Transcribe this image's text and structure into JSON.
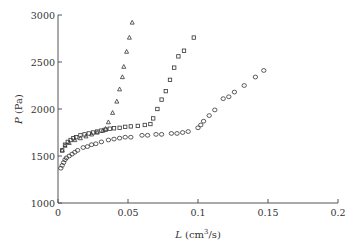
{
  "chart_data": {
    "type": "scatter",
    "title": "",
    "xlabel": "L (cm³/s)",
    "xlabel_parts": {
      "var": "L",
      "unit_pre": " (cm",
      "sup": "3",
      "unit_post": "/s)"
    },
    "ylabel": "P (Pa)",
    "ylabel_parts": {
      "var": "P",
      "unit": " (Pa)"
    },
    "xlim": [
      0,
      0.2
    ],
    "ylim": [
      1000,
      3000
    ],
    "xticks": [
      0,
      0.05,
      0.1,
      0.15,
      0.2
    ],
    "xtick_labels": [
      "0",
      "0.05",
      "0.1",
      "0.15",
      "0.2"
    ],
    "yticks": [
      1000,
      1500,
      2000,
      2500,
      3000
    ],
    "ytick_labels": [
      "1000",
      "1500",
      "2000",
      "2500",
      "3000"
    ],
    "grid": false,
    "legend": null,
    "series": [
      {
        "name": "triangles",
        "marker": "triangle",
        "points": [
          [
            0.003,
            1560
          ],
          [
            0.005,
            1610
          ],
          [
            0.008,
            1640
          ],
          [
            0.012,
            1670
          ],
          [
            0.016,
            1690
          ],
          [
            0.02,
            1710
          ],
          [
            0.024,
            1730
          ],
          [
            0.028,
            1750
          ],
          [
            0.032,
            1770
          ],
          [
            0.034,
            1790
          ],
          [
            0.036,
            1860
          ],
          [
            0.039,
            1960
          ],
          [
            0.042,
            2080
          ],
          [
            0.044,
            2210
          ],
          [
            0.046,
            2340
          ],
          [
            0.047,
            2450
          ],
          [
            0.049,
            2610
          ],
          [
            0.051,
            2760
          ],
          [
            0.053,
            2920
          ]
        ]
      },
      {
        "name": "squares",
        "marker": "square",
        "points": [
          [
            0.003,
            1560
          ],
          [
            0.005,
            1620
          ],
          [
            0.007,
            1650
          ],
          [
            0.009,
            1670
          ],
          [
            0.011,
            1690
          ],
          [
            0.013,
            1700
          ],
          [
            0.016,
            1720
          ],
          [
            0.019,
            1730
          ],
          [
            0.022,
            1740
          ],
          [
            0.025,
            1750
          ],
          [
            0.028,
            1760
          ],
          [
            0.031,
            1770
          ],
          [
            0.034,
            1780
          ],
          [
            0.037,
            1790
          ],
          [
            0.04,
            1795
          ],
          [
            0.044,
            1800
          ],
          [
            0.048,
            1810
          ],
          [
            0.052,
            1815
          ],
          [
            0.057,
            1820
          ],
          [
            0.062,
            1830
          ],
          [
            0.066,
            1840
          ],
          [
            0.068,
            1900
          ],
          [
            0.071,
            2000
          ],
          [
            0.074,
            2100
          ],
          [
            0.077,
            2190
          ],
          [
            0.08,
            2310
          ],
          [
            0.083,
            2440
          ],
          [
            0.086,
            2560
          ],
          [
            0.09,
            2620
          ],
          [
            0.097,
            2760
          ]
        ]
      },
      {
        "name": "circles",
        "marker": "circle",
        "points": [
          [
            0.002,
            1370
          ],
          [
            0.003,
            1400
          ],
          [
            0.004,
            1430
          ],
          [
            0.005,
            1460
          ],
          [
            0.006,
            1480
          ],
          [
            0.008,
            1500
          ],
          [
            0.01,
            1520
          ],
          [
            0.012,
            1540
          ],
          [
            0.014,
            1560
          ],
          [
            0.018,
            1590
          ],
          [
            0.021,
            1600
          ],
          [
            0.024,
            1620
          ],
          [
            0.027,
            1630
          ],
          [
            0.031,
            1650
          ],
          [
            0.036,
            1670
          ],
          [
            0.04,
            1680
          ],
          [
            0.044,
            1690
          ],
          [
            0.048,
            1700
          ],
          [
            0.052,
            1700
          ],
          [
            0.06,
            1720
          ],
          [
            0.064,
            1720
          ],
          [
            0.07,
            1730
          ],
          [
            0.074,
            1730
          ],
          [
            0.081,
            1740
          ],
          [
            0.085,
            1740
          ],
          [
            0.089,
            1750
          ],
          [
            0.093,
            1760
          ],
          [
            0.1,
            1800
          ],
          [
            0.102,
            1830
          ],
          [
            0.104,
            1870
          ],
          [
            0.108,
            1930
          ],
          [
            0.112,
            1990
          ],
          [
            0.118,
            2110
          ],
          [
            0.122,
            2130
          ],
          [
            0.126,
            2180
          ],
          [
            0.133,
            2250
          ],
          [
            0.141,
            2340
          ],
          [
            0.147,
            2410
          ]
        ]
      }
    ]
  }
}
